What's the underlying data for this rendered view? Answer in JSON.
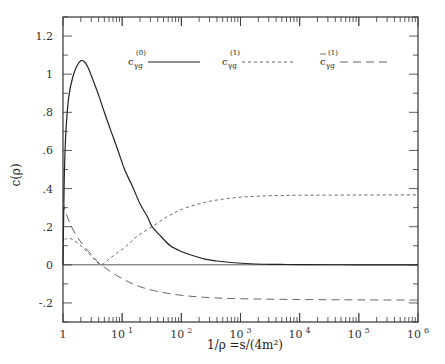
{
  "chart_data": {
    "type": "line",
    "title": "",
    "xlabel": "1/ρ =s/(4m²)",
    "ylabel": "c(ρ)",
    "xscale": "log",
    "xlim": [
      1,
      1000000
    ],
    "ylim": [
      -0.3,
      1.3
    ],
    "grid": false,
    "legend_position": "top-inside",
    "x_tick_labels": [
      {
        "value": 1,
        "base": "1",
        "exp": ""
      },
      {
        "value": 10,
        "base": "10",
        "exp": "1"
      },
      {
        "value": 100,
        "base": "10",
        "exp": "2"
      },
      {
        "value": 1000,
        "base": "10",
        "exp": "3"
      },
      {
        "value": 10000,
        "base": "10",
        "exp": "4"
      },
      {
        "value": 100000,
        "base": "10",
        "exp": "5"
      },
      {
        "value": 1000000,
        "base": "10",
        "exp": "6"
      }
    ],
    "y_tick_labels": [
      {
        "value": 1.2,
        "label": "1.2"
      },
      {
        "value": 1.0,
        "label": "1"
      },
      {
        "value": 0.8,
        "label": ".8"
      },
      {
        "value": 0.6,
        "label": ".6"
      },
      {
        "value": 0.4,
        "label": ".4"
      },
      {
        "value": 0.2,
        "label": ".2"
      },
      {
        "value": 0.0,
        "label": "0"
      },
      {
        "value": -0.2,
        "label": "-.2"
      }
    ],
    "series": [
      {
        "name": "c_γg^(0)",
        "legend_base": "c",
        "legend_sub": "γg",
        "legend_sup": "(0)",
        "legend_bar": false,
        "style": "solid",
        "color": "#222222",
        "x": [
          1.0,
          1.05,
          1.12,
          1.25,
          1.45,
          1.7,
          2.0,
          2.3,
          2.7,
          3.2,
          4.0,
          5.0,
          6.5,
          8.5,
          11,
          15,
          20,
          27,
          32,
          45,
          65,
          100,
          150,
          250,
          400,
          700,
          1200,
          2500,
          5000,
          10000,
          100000,
          1000000
        ],
        "y": [
          0.0,
          0.45,
          0.7,
          0.88,
          0.98,
          1.04,
          1.07,
          1.065,
          1.03,
          0.97,
          0.89,
          0.8,
          0.7,
          0.6,
          0.5,
          0.41,
          0.32,
          0.25,
          0.2,
          0.15,
          0.1,
          0.07,
          0.05,
          0.03,
          0.02,
          0.012,
          0.007,
          0.003,
          0.002,
          0.001,
          0.0,
          0.0
        ]
      },
      {
        "name": "c_γg^(1)",
        "legend_base": "c",
        "legend_sub": "γg",
        "legend_sup": "(1)",
        "legend_bar": false,
        "style": "short-dash",
        "color": "#555555",
        "x": [
          1.0,
          1.1,
          1.25,
          1.5,
          2.0,
          2.7,
          3.5,
          4.4,
          6.0,
          8.0,
          12,
          18,
          32,
          60,
          100,
          200,
          400,
          1000,
          3000,
          10000,
          100000,
          1000000
        ],
        "y": [
          0.1,
          0.135,
          0.14,
          0.13,
          0.1,
          0.06,
          0.025,
          0.0,
          0.03,
          0.06,
          0.1,
          0.15,
          0.2,
          0.255,
          0.29,
          0.32,
          0.34,
          0.355,
          0.362,
          0.365,
          0.366,
          0.367
        ]
      },
      {
        "name": "c̄_γg^(1)",
        "legend_base": "c",
        "legend_sub": "γg",
        "legend_sup": "(1)",
        "legend_bar": true,
        "style": "long-dash",
        "color": "#555555",
        "x": [
          1.0,
          1.1,
          1.3,
          1.6,
          2.0,
          2.7,
          3.5,
          4.4,
          6.0,
          8.0,
          12,
          20,
          40,
          100,
          300,
          1000,
          10000,
          100000,
          1000000
        ],
        "y": [
          0.33,
          0.28,
          0.22,
          0.165,
          0.12,
          0.07,
          0.03,
          0.0,
          -0.03,
          -0.055,
          -0.085,
          -0.115,
          -0.14,
          -0.16,
          -0.172,
          -0.178,
          -0.182,
          -0.184,
          -0.185
        ]
      }
    ],
    "reference_lines": [
      {
        "axis": "y",
        "value": 0,
        "style": "solid"
      }
    ]
  }
}
